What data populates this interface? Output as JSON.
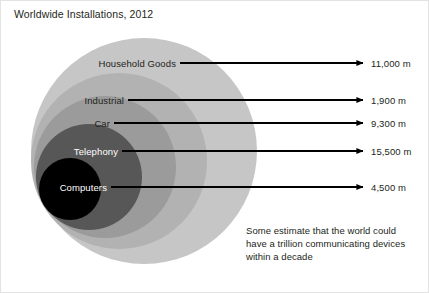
{
  "title": "Worldwide Installations, 2012",
  "footnote": {
    "lines": [
      "Some estimate that the world could",
      "have a trillion communicating devices",
      "within a decade"
    ]
  },
  "colors": {
    "background": "#ffffff",
    "text": "#231f20",
    "text_inverse": "#ffffff",
    "arrow": "#000000",
    "border": "#e3e3e3",
    "ring_household": "#c6c6c6",
    "ring_industrial": "#b2b2b2",
    "ring_car": "#9b9b9b",
    "ring_telephony": "#575757",
    "ring_computers": "#000000"
  },
  "chart_data": {
    "type": "pie",
    "title": "Worldwide Installations, 2012",
    "subtitle": "",
    "xlabel": "",
    "ylabel": "",
    "legend_position": "inline-labels",
    "grid": false,
    "units": "m",
    "note": "Nested concentric circles, each annotated with an arrow pointing to its installed-base value in millions of units.",
    "categories": [
      "Household Goods",
      "Industrial",
      "Car",
      "Telephony",
      "Computers"
    ],
    "values": [
      11000,
      1900,
      9300,
      15500,
      4500
    ],
    "value_labels": [
      "11,000 m",
      "1,900 m",
      "9,300 m",
      "15,500 m",
      "4,500 m"
    ],
    "series": [
      {
        "name": "Worldwide Installations 2012",
        "values": [
          11000,
          1900,
          9300,
          15500,
          4500
        ]
      }
    ],
    "rings": [
      {
        "label": "Household Goods",
        "value": 11000,
        "value_label": "11,000 m",
        "fill": "#c6c6c6",
        "label_color": "dark",
        "cx": 143,
        "cy": 150,
        "r": 113,
        "label_right": 175,
        "label_y": 62,
        "arrow_x1": 179,
        "arrow_x2": 362,
        "arrow_y": 62,
        "value_x": 370
      },
      {
        "label": "Industrial",
        "value": 1900,
        "value_label": "1,900 m",
        "fill": "#b2b2b2",
        "label_color": "dark",
        "cx": 118,
        "cy": 160,
        "r": 88,
        "label_right": 123,
        "label_y": 99,
        "arrow_x1": 127,
        "arrow_x2": 362,
        "arrow_y": 99,
        "value_x": 370
      },
      {
        "label": "Car",
        "value": 9300,
        "value_label": "9,300 m",
        "fill": "#9b9b9b",
        "label_color": "dark",
        "cx": 104,
        "cy": 166,
        "r": 71,
        "label_right": 109,
        "label_y": 122,
        "arrow_x1": 113,
        "arrow_x2": 362,
        "arrow_y": 122,
        "value_x": 370
      },
      {
        "label": "Telephony",
        "value": 15500,
        "value_label": "15,500 m",
        "fill": "#575757",
        "label_color": "light",
        "cx": 88,
        "cy": 176,
        "r": 53,
        "label_right": 117,
        "label_y": 150,
        "arrow_x1": 121,
        "arrow_x2": 362,
        "arrow_y": 150,
        "value_x": 370
      },
      {
        "label": "Computers",
        "value": 4500,
        "value_label": "4,500 m",
        "fill": "#000000",
        "label_color": "light",
        "cx": 69,
        "cy": 188,
        "r": 31,
        "label_right": 106,
        "label_y": 186,
        "arrow_x1": 110,
        "arrow_x2": 362,
        "arrow_y": 186,
        "value_x": 370
      }
    ]
  }
}
